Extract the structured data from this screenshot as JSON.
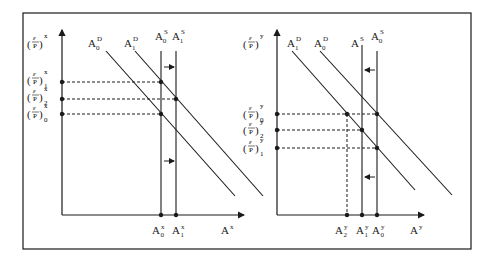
{
  "diagram": {
    "type": "two-panel supply-demand diagram",
    "left_panel": {
      "y_axis_label": {
        "base": "(ε/P)",
        "sup": "x"
      },
      "x_axis_label": {
        "base": "A",
        "sup": "x"
      },
      "curves": [
        {
          "id": "A0D",
          "base": "A",
          "sup": "D",
          "sub": "0"
        },
        {
          "id": "A1D",
          "base": "A",
          "sup": "D",
          "sub": "1"
        },
        {
          "id": "A0S",
          "base": "A",
          "sup": "S",
          "sub": "0"
        },
        {
          "id": "A1S",
          "base": "A",
          "sup": "S",
          "sub": "1"
        }
      ],
      "y_levels": [
        {
          "base": "(ε/P)",
          "sup": "x",
          "sub": "1"
        },
        {
          "base": "(ε/P)",
          "sup": "x",
          "sub": "2"
        },
        {
          "base": "(ε/P)",
          "sup": "x",
          "sub": "0"
        }
      ],
      "x_ticks": [
        {
          "base": "A",
          "sup": "x",
          "sub": "0"
        },
        {
          "base": "A",
          "sup": "x",
          "sub": "1"
        }
      ],
      "shift_arrows": "right"
    },
    "right_panel": {
      "y_axis_label": {
        "base": "(ε/P)",
        "sup": "y"
      },
      "x_axis_label": {
        "base": "A",
        "sup": "y"
      },
      "curves": [
        {
          "id": "A1D",
          "base": "A",
          "sup": "D",
          "sub": "1"
        },
        {
          "id": "A0D",
          "base": "A",
          "sup": "D",
          "sub": "0"
        },
        {
          "id": "AS",
          "base": "A",
          "sup": "S",
          "sub": ""
        },
        {
          "id": "A0S",
          "base": "A",
          "sup": "S",
          "sub": "0"
        }
      ],
      "y_levels": [
        {
          "base": "(ε/P)",
          "sup": "y",
          "sub": "0"
        },
        {
          "base": "(ε/P)",
          "sup": "y",
          "sub": "2"
        },
        {
          "base": "(ε/P)",
          "sup": "y",
          "sub": "1"
        }
      ],
      "x_ticks": [
        {
          "base": "A",
          "sup": "y",
          "sub": "2"
        },
        {
          "base": "A",
          "sup": "y",
          "sub": "1"
        },
        {
          "base": "A",
          "sup": "y",
          "sub": "0"
        }
      ],
      "shift_arrows": "left"
    }
  }
}
